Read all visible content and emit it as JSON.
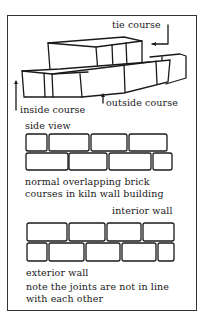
{
  "figure": {
    "top_diagram": {
      "labels": {
        "tie_course": "tie course",
        "inside_course": "inside course",
        "outside_course": "outside course"
      }
    },
    "side_view": {
      "title": "side view",
      "caption_line1": "normal overlapping brick",
      "caption_line2": "courses in kiln wall building"
    },
    "wall_view": {
      "interior_label": "interior wall",
      "exterior_label": "exterior wall",
      "note_line1": "note the joints are not in line",
      "note_line2": "with each other"
    }
  }
}
